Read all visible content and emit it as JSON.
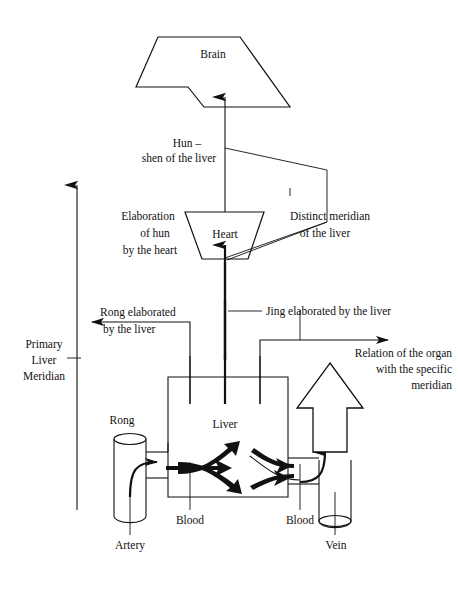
{
  "diagram": {
    "nodes": {
      "brain": "Brain",
      "heart": "Heart",
      "liver": "Liver"
    },
    "labels": {
      "hun_line1": "Hun –",
      "hun_line2": "shen of the liver",
      "elaboration_line1": "Elaboration",
      "elaboration_line2": "of hun",
      "elaboration_line3": "by the heart",
      "distinct_meridian_line1": "Distinct meridian",
      "distinct_meridian_line2": "of the liver",
      "jing": "Jing elaborated by the liver",
      "rong_elaborated_line1": "Rong elaborated",
      "rong_elaborated_line2": "by the liver",
      "primary_line1": "Primary",
      "primary_line2": "Liver",
      "primary_line3": "Meridian",
      "relation_line1": "Relation of the organ",
      "relation_line2": "with the specific",
      "relation_line3": "meridian",
      "rong": "Rong",
      "blood_left": "Blood",
      "blood_right": "Blood",
      "artery": "Artery",
      "vein": "Vein"
    },
    "colors": {
      "ink": "#111111",
      "paper": "#ffffff"
    }
  }
}
